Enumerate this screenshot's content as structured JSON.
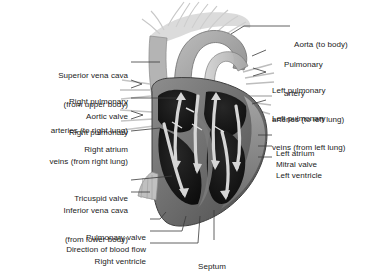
{
  "figure": {
    "background_color": "#ffffff",
    "text_color": "#1b1b1b",
    "leader_line_color": "#3a3a3a",
    "palette": {
      "chamber_dark": "#141414",
      "muscle_gray": "#6f6f6f",
      "muscle_mid": "#575757",
      "wall_light": "#9a9a9a",
      "vessel_pale": "#c9c9c9",
      "arrow_light": "#d8d8d8",
      "vessel_wisp": "#b8b8b8"
    }
  },
  "labels_left": [
    {
      "id": "superior-vena-cava",
      "lines": [
        "Superior vena cava",
        "(from upper body)"
      ]
    },
    {
      "id": "right-pulmonary-arteries",
      "lines": [
        "Right pulmonary",
        "arteries (to right lung)"
      ]
    },
    {
      "id": "aortic-valve",
      "lines": [
        "Aortic valve"
      ]
    },
    {
      "id": "right-pulmonary-veins",
      "lines": [
        "Right pulmonary",
        "veins (from right lung)"
      ]
    },
    {
      "id": "right-atrium",
      "lines": [
        "Right atrium"
      ]
    },
    {
      "id": "tricuspid-valve",
      "lines": [
        "Tricuspid valve"
      ]
    },
    {
      "id": "inferior-vena-cava",
      "lines": [
        "Inferior vena cava",
        "(from lower body)"
      ]
    }
  ],
  "labels_right": [
    {
      "id": "aorta",
      "lines": [
        "Aorta (to body)"
      ]
    },
    {
      "id": "pulmonary-artery",
      "lines": [
        "Pulmonary",
        "artery"
      ]
    },
    {
      "id": "left-pulmonary-arteries",
      "lines": [
        "Left pulmonary",
        "arteries (to left lung)"
      ]
    },
    {
      "id": "left-pulmonary-veins",
      "lines": [
        "Left pulmonary",
        "veins (from left lung)"
      ]
    },
    {
      "id": "left-atrium",
      "lines": [
        "Left atrium"
      ]
    },
    {
      "id": "mitral-valve",
      "lines": [
        "Mitral valve"
      ]
    },
    {
      "id": "left-ventricle",
      "lines": [
        "Left ventricle"
      ]
    }
  ],
  "labels_bottom": [
    {
      "id": "pulmonary-valve",
      "lines": [
        "Pulmonary valve"
      ]
    },
    {
      "id": "direction-of-blood-flow",
      "lines": [
        "Direction of blood flow"
      ]
    },
    {
      "id": "right-ventricle",
      "lines": [
        "Right ventricle"
      ]
    },
    {
      "id": "septum",
      "lines": [
        "Septum"
      ]
    }
  ],
  "text": {
    "superior_vena_cava_1": "Superior vena cava",
    "superior_vena_cava_2": "(from upper body)",
    "right_pulmonary_arteries_1": "Right pulmonary",
    "right_pulmonary_arteries_2": "arteries (to right lung)",
    "aortic_valve": "Aortic valve",
    "right_pulmonary_veins_1": "Right pulmonary",
    "right_pulmonary_veins_2": "veins (from right lung)",
    "right_atrium": "Right atrium",
    "tricuspid_valve": "Tricuspid valve",
    "inferior_vena_cava_1": "Inferior vena cava",
    "inferior_vena_cava_2": "(from lower body)",
    "aorta": "Aorta (to body)",
    "pulmonary_artery_1": "Pulmonary",
    "pulmonary_artery_2": "artery",
    "left_pulmonary_arteries_1": "Left pulmonary",
    "left_pulmonary_arteries_2": "arteries (to left lung)",
    "left_pulmonary_veins_1": "Left pulmonary",
    "left_pulmonary_veins_2": "veins (from left lung)",
    "left_atrium": "Left atrium",
    "mitral_valve": "Mitral valve",
    "left_ventricle": "Left ventricle",
    "pulmonary_valve": "Pulmonary valve",
    "direction_of_blood_flow": "Direction of blood flow",
    "right_ventricle": "Right ventricle",
    "septum": "Septum"
  }
}
